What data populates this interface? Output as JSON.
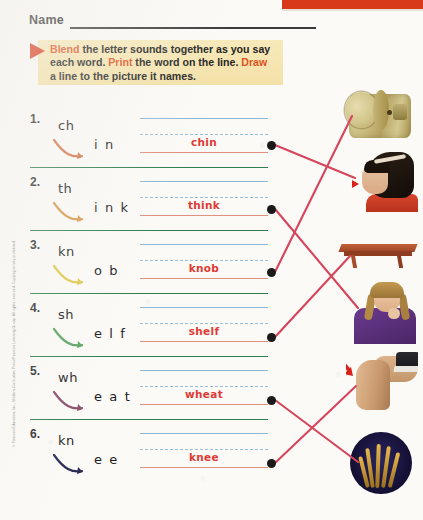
{
  "page": {
    "name_label": "Name",
    "copyright": "© Pearson Education, Inc., Modern Curriculum Press/Pearson Learning Group. All rights reserved. Copying strictly prohibited."
  },
  "instructions": {
    "kw1": "Blend",
    "text1": " the letter sounds together as you say",
    "text2": "each word. ",
    "kw2": "Print",
    "text3": " the word on the line.",
    "kw3": "Draw",
    "text4": " a line to the picture it names."
  },
  "colors": {
    "banner_red": "#d8391b",
    "instruction_bg": "#f3e1a8",
    "keyword_orange": "#e0521f",
    "answer_red": "#e03a35",
    "divider_green": "#2e7d4f",
    "hw_top_blue": "#8fb6d4",
    "hw_mid_blue": "#9dc0da",
    "hw_base_salmon": "#e0907e",
    "match_line": "#d6455c",
    "dot_black": "#1a1a1a"
  },
  "exercises": [
    {
      "number": "1.",
      "onset": "ch",
      "rime": "i n",
      "answer": "chin",
      "arrow_color": "#d4764e"
    },
    {
      "number": "2.",
      "onset": "th",
      "rime": "i n k",
      "answer": "think",
      "arrow_color": "#d79a4e"
    },
    {
      "number": "3.",
      "onset": "kn",
      "rime": "o b",
      "answer": "knob",
      "arrow_color": "#e0c84a"
    },
    {
      "number": "4.",
      "onset": "sh",
      "rime": "e l f",
      "answer": "shelf",
      "arrow_color": "#5aa35f"
    },
    {
      "number": "5.",
      "onset": "wh",
      "rime": "e a t",
      "answer": "wheat",
      "arrow_color": "#8a4f6d"
    },
    {
      "number": "6.",
      "onset": "kn",
      "rime": "e e",
      "answer": "knee",
      "arrow_color": "#2b2b55"
    }
  ],
  "pictures": [
    {
      "name": "doorknob-photo",
      "matches_word": "knob"
    },
    {
      "name": "girl-chin-photo",
      "matches_word": "chin"
    },
    {
      "name": "shelf-photo",
      "matches_word": "shelf"
    },
    {
      "name": "girl-thinking-photo",
      "matches_word": "think"
    },
    {
      "name": "knee-photo",
      "matches_word": "knee"
    },
    {
      "name": "wheat-photo",
      "matches_word": "wheat"
    }
  ]
}
